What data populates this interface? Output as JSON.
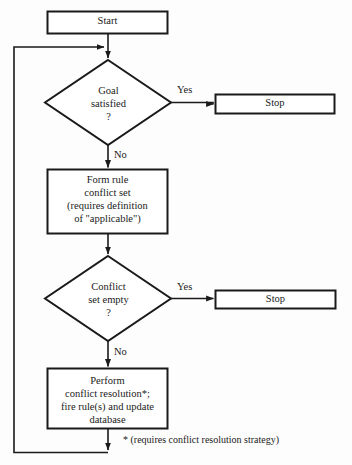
{
  "diagram": {
    "type": "flowchart",
    "background_color": "#fdfdfd",
    "line_color": "#1a1a1a",
    "text_color": "#1a1a1a",
    "nodes": [
      {
        "id": "start",
        "shape": "rectangle",
        "label": "Start"
      },
      {
        "id": "goal-satisfied",
        "shape": "diamond",
        "label_line1": "Goal",
        "label_line2": "satisfied",
        "label_line3": "?"
      },
      {
        "id": "stop-goal",
        "shape": "rectangle",
        "label": "Stop"
      },
      {
        "id": "form-rule-conflict-set",
        "shape": "rectangle",
        "label_line1": "Form rule",
        "label_line2": "conflict set",
        "label_line3": "(requires definition",
        "label_line4": "of \"applicable\")"
      },
      {
        "id": "conflict-set-empty",
        "shape": "diamond",
        "label_line1": "Conflict",
        "label_line2": "set empty",
        "label_line3": "?"
      },
      {
        "id": "stop-conflict",
        "shape": "rectangle",
        "label": "Stop"
      },
      {
        "id": "perform-conflict-resolution",
        "shape": "rectangle",
        "label_line1": "Perform",
        "label_line2": "conflict resolution*;",
        "label_line3": "fire rule(s) and update",
        "label_line4": "database"
      }
    ],
    "edge_labels": {
      "goal_yes": "Yes",
      "goal_no": "No",
      "conflict_yes": "Yes",
      "conflict_no": "No"
    },
    "footnote": "* (requires conflict resolution strategy)"
  }
}
